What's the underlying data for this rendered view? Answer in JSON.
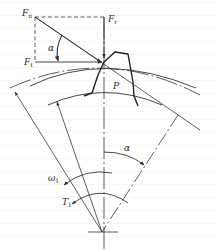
{
  "figure": {
    "type": "gear tooth force diagram",
    "labels": {
      "normal_force": {
        "main": "F",
        "sub": "n"
      },
      "radial_force": {
        "main": "F",
        "sub": "r"
      },
      "tangential_force": {
        "main": "F",
        "sub": "t"
      },
      "pressure_angle_top": "α",
      "pressure_angle_bottom": "α",
      "pitch_point": "P",
      "angular_velocity": {
        "main": "ω",
        "sub": "1"
      },
      "torque": {
        "main": "T",
        "sub": "1"
      }
    },
    "colors": {
      "line": "#333333",
      "background": "#ffffff"
    }
  }
}
